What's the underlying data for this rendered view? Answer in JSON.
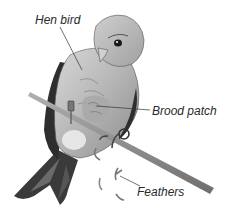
{
  "diagram": {
    "labels": {
      "hen_bird": "Hen bird",
      "brood_patch": "Brood patch",
      "feathers": "Feathers"
    },
    "colors": {
      "background": "#ffffff",
      "label_text": "#2a2a2a",
      "leader_line": "#333333",
      "bird_light": "#c9c9c9",
      "bird_mid": "#9a9a9a",
      "bird_dark": "#2e2e2e",
      "twig": "#8a8a8a"
    }
  }
}
